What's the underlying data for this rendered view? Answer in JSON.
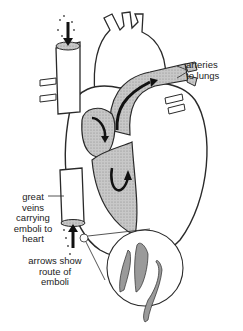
{
  "figure": {
    "labels": {
      "arteries": [
        "arteries",
        "to lungs"
      ],
      "veins": [
        "great",
        "veins",
        "carrying",
        "emboli to",
        "heart"
      ],
      "arrows": [
        "arrows show",
        "route of",
        "emboli"
      ]
    },
    "colors": {
      "line": "#2a2a2a",
      "shade": "#bdbdbd",
      "shade_dark": "#8c8c8c",
      "arrow": "#111111",
      "background": "#ffffff"
    }
  }
}
